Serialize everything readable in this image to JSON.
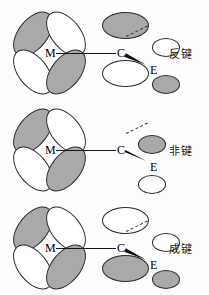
{
  "chart_data": {
    "type": "diagram",
    "rows": [
      {
        "label": "反键",
        "label_meaning": "antibonding",
        "atoms": [
          "M",
          "C",
          "E"
        ],
        "metal_lobes": {
          "upper_left": "shaded",
          "upper_right": "white",
          "lower_left": "white",
          "lower_right": "shaded"
        },
        "carbon_lobes": {
          "upper": "shaded",
          "lower": "white"
        },
        "substituent_lobes": {
          "upper": "white",
          "lower": "shaded"
        }
      },
      {
        "label": "非键",
        "label_meaning": "non-bonding",
        "atoms": [
          "M",
          "C",
          "E"
        ],
        "metal_lobes": {
          "upper_left": "shaded",
          "upper_right": "white",
          "lower_left": "white",
          "lower_right": "shaded"
        },
        "carbon_lobes": {
          "upper": "none",
          "lower": "none"
        },
        "substituent_lobes": {
          "upper": "shaded",
          "lower": "white"
        }
      },
      {
        "label": "成键",
        "label_meaning": "bonding",
        "atoms": [
          "M",
          "C",
          "E"
        ],
        "metal_lobes": {
          "upper_left": "shaded",
          "upper_right": "white",
          "lower_left": "white",
          "lower_right": "shaded"
        },
        "carbon_lobes": {
          "upper": "white",
          "lower": "shaded"
        },
        "substituent_lobes": {
          "upper": "white",
          "lower": "shaded"
        }
      }
    ],
    "colors": {
      "shaded_lobe": "#a9a9a9",
      "white_lobe": "#ffffff",
      "outline": "#2b2b2b",
      "bond": "#151515",
      "background": "#fdfdfd"
    },
    "legend": []
  },
  "atoms": {
    "metal": "M",
    "carbon": "C",
    "substituent": "E"
  },
  "rows": {
    "r1": {
      "label": "反键"
    },
    "r2": {
      "label": "非键"
    },
    "r3": {
      "label": "成键"
    }
  }
}
